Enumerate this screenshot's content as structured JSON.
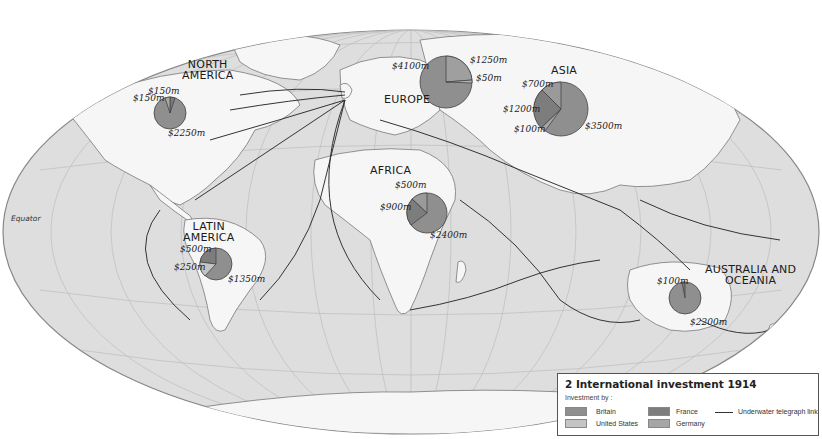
{
  "map": {
    "title": "2 International investment 1914",
    "equator_label": "Equator",
    "colors": {
      "land": "#f4f4f4",
      "ocean": "#dcdcdc",
      "britain": "#8f8f8f",
      "united_states": "#c4c4c4",
      "france": "#7d7d7d",
      "germany": "#a6a6a6",
      "telegraph": "#333333"
    },
    "regions": [
      {
        "name": "NORTH AMERICA",
        "label_lines": [
          "NORTH",
          "AMERICA"
        ],
        "values": [
          "$150m",
          "$150m",
          "$2250m"
        ]
      },
      {
        "name": "EUROPE",
        "label_lines": [
          "EUROPE"
        ],
        "values": [
          "$4100m",
          "$1250m",
          "$50m"
        ]
      },
      {
        "name": "ASIA",
        "label_lines": [
          "ASIA"
        ],
        "values": [
          "$700m",
          "$1200m",
          "$100m",
          "$3500m"
        ]
      },
      {
        "name": "AFRICA",
        "label_lines": [
          "AFRICA"
        ],
        "values": [
          "$500m",
          "$900m",
          "$2400m"
        ]
      },
      {
        "name": "LATIN AMERICA",
        "label_lines": [
          "LATIN",
          "AMERICA"
        ],
        "values": [
          "$500m",
          "$250m",
          "$1350m"
        ]
      },
      {
        "name": "AUSTRALIA AND OCEANIA",
        "label_lines": [
          "AUSTRALIA AND",
          "OCEANIA"
        ],
        "values": [
          "$100m",
          "$2200m"
        ]
      }
    ]
  },
  "legend": {
    "title": "2 International investment 1914",
    "subtitle": "Investment by :",
    "items": [
      {
        "label": "Britain",
        "color": "#8f8f8f"
      },
      {
        "label": "United States",
        "color": "#c4c4c4"
      },
      {
        "label": "France",
        "color": "#7d7d7d"
      },
      {
        "label": "Germany",
        "color": "#a6a6a6"
      }
    ],
    "line_item": "Underwater telegraph link"
  }
}
